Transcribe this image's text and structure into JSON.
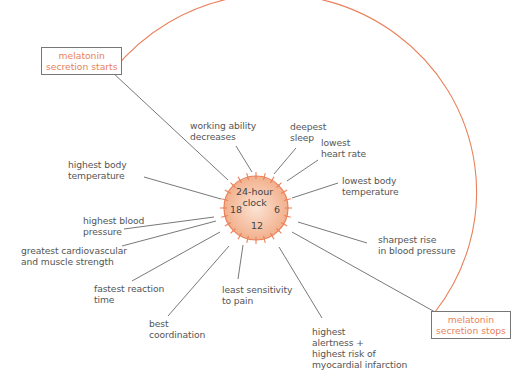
{
  "colors": {
    "accent": "#e9815a",
    "line": "#555555",
    "clock_fill": "#f6c9ad"
  },
  "clock": {
    "title": "24-hour\nclock",
    "h18": "18",
    "h6": "6",
    "h12": "12"
  },
  "melatonin": {
    "start": "melatonin\nsecretion starts",
    "stop": "melatonin\nsecretion stops"
  },
  "labels": [
    {
      "id": "working-ability",
      "text": "working ability\ndecreases"
    },
    {
      "id": "deepest-sleep",
      "text": "deepest\nsleep"
    },
    {
      "id": "lowest-heart-rate",
      "text": "lowest\nheart rate"
    },
    {
      "id": "lowest-body-temp",
      "text": "lowest body\ntemperature"
    },
    {
      "id": "highest-body-temp",
      "text": "highest body\ntemperature"
    },
    {
      "id": "highest-blood-pressure",
      "text": "highest blood\npressure"
    },
    {
      "id": "cardio-strength",
      "text": "greatest cardiovascular\nand muscle strength"
    },
    {
      "id": "sharpest-rise",
      "text": "sharpest rise\nin blood pressure"
    },
    {
      "id": "fastest-reaction",
      "text": "fastest reaction\ntime"
    },
    {
      "id": "least-pain",
      "text": "least sensitivity\nto pain"
    },
    {
      "id": "best-coordination",
      "text": "best\ncoordination"
    },
    {
      "id": "highest-alertness",
      "text": "highest\nalertness +\nhighest risk of\nmyocardial infarction"
    }
  ]
}
